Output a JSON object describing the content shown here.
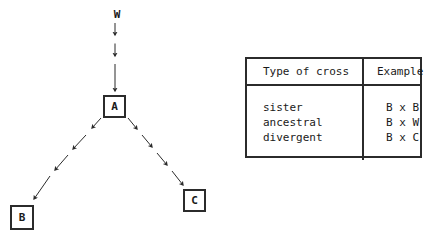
{
  "diagram": {
    "nodes": [
      {
        "id": "w",
        "label": "W",
        "boxed": false
      },
      {
        "id": "a",
        "label": "A",
        "boxed": true
      },
      {
        "id": "b",
        "label": "B",
        "boxed": true
      },
      {
        "id": "c",
        "label": "C",
        "boxed": true
      }
    ],
    "edges": [
      {
        "from": "W",
        "to": "A",
        "style": "dashed-arrow",
        "direction": "down"
      },
      {
        "from": "A",
        "to": "B",
        "style": "dashed-arrow",
        "direction": "down-left"
      },
      {
        "from": "A",
        "to": "C",
        "style": "dashed-arrow",
        "direction": "down-right"
      }
    ],
    "line_color": "#2b2b2b"
  },
  "table": {
    "headers": [
      "Type of cross",
      "Example"
    ],
    "rows": [
      {
        "type": "sister",
        "example": "B x B"
      },
      {
        "type": "ancestral",
        "example": "B x W"
      },
      {
        "type": "divergent",
        "example": "B x C"
      }
    ],
    "border_color": "#2b2b2b"
  }
}
